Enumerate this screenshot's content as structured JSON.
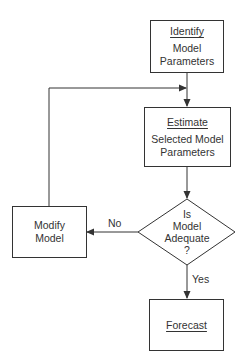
{
  "diagram": {
    "nodes": {
      "identify": {
        "heading": "Identify",
        "line1": "Model",
        "line2": "Parameters"
      },
      "estimate": {
        "heading": "Estimate",
        "line1": "Selected Model",
        "line2": "Parameters"
      },
      "decision": {
        "line1": "Is",
        "line2": "Model",
        "line3": "Adequate",
        "line4": "?"
      },
      "modify": {
        "line1": "Modify",
        "line2": "Model"
      },
      "forecast": {
        "heading": "Forecast"
      }
    },
    "edges": {
      "no_label": "No",
      "yes_label": "Yes"
    },
    "colors": {
      "line": "#333333",
      "background": "#ffffff"
    }
  }
}
